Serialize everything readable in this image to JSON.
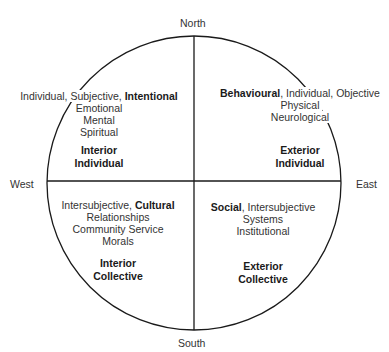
{
  "compass": {
    "north": "North",
    "south": "South",
    "east": "East",
    "west": "West"
  },
  "quadrants": {
    "upper_left": {
      "line1_normal": "Individual, Subjective, ",
      "line1_bold": "Intentional",
      "items": [
        "Emotional",
        "Mental",
        "Spiritual"
      ],
      "title": [
        "Interior",
        "Individual"
      ]
    },
    "upper_right": {
      "line1_bold": "Behavioural",
      "line1_normal": ", Individual, Objective",
      "items": [
        "Physical",
        "Neurological"
      ],
      "title": [
        "Exterior",
        "Individual"
      ]
    },
    "lower_left": {
      "line1_normal": "Intersubjective, ",
      "line1_bold": "Cultural",
      "items": [
        "Relationships",
        "Community Service",
        "Morals"
      ],
      "title": [
        "Interior",
        "Collective"
      ]
    },
    "lower_right": {
      "line1_bold": "Social",
      "line1_normal": ", Intersubjective",
      "items": [
        "Systems",
        "Institutional"
      ],
      "title": [
        "Exterior",
        "Collective"
      ]
    }
  },
  "style": {
    "line_color": "#1a1a1a",
    "text_color": "#333333",
    "background": "#ffffff"
  }
}
